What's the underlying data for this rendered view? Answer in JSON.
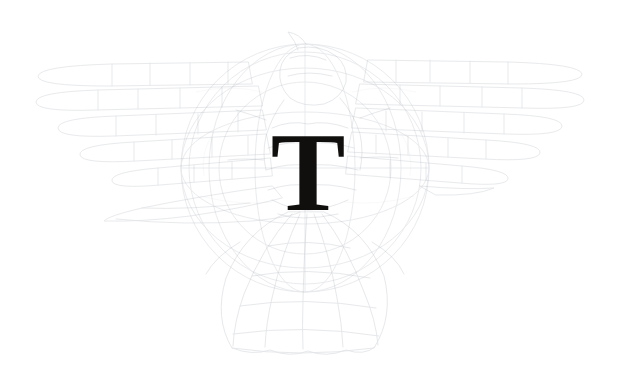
{
  "page": {
    "width": 618,
    "height": 388,
    "background_color": "#ffffff",
    "media": "scanned-book-page"
  },
  "dropcap": {
    "letter": "T",
    "color": "#100f0d",
    "style": "serif-roman-bracketed-serifs",
    "bbox": {
      "x": 277,
      "y": 128,
      "width": 71,
      "height": 75
    }
  },
  "watermark": {
    "name": "winged-eagle-emblem",
    "ink_color": "#9aa0ab",
    "opacity": "very-faint",
    "bbox": {
      "x": 35,
      "y": 42,
      "width": 552,
      "height": 310
    },
    "parts": [
      {
        "name": "left-wing",
        "description": "outspread wing of stacked horizontal feather bands extending to the left edge",
        "feather_rows": 5
      },
      {
        "name": "right-wing",
        "description": "outspread wing of stacked horizontal feather bands with rounded tips extending to the right edge",
        "feather_rows": 5
      },
      {
        "name": "center-ring",
        "description": "circular ring / wheel-globe behind the body",
        "cx": 305,
        "cy": 168,
        "r": 124
      },
      {
        "name": "body-head",
        "description": "bird head and body with a pointed beak angled toward lower left"
      },
      {
        "name": "tail-fan",
        "description": "radiating fan of tail feathers spreading below the body"
      }
    ]
  }
}
